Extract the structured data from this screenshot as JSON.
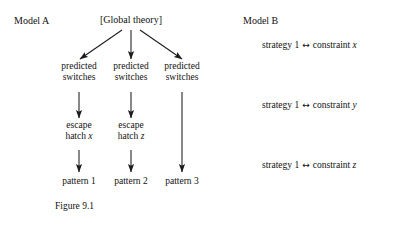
{
  "figure": {
    "caption": "Figure 9.1",
    "background_color": "#ffffff",
    "ink_color": "#1a1a1a"
  },
  "model_a": {
    "title": "Model A",
    "root": {
      "label": "[Global theory]"
    },
    "level_predicted": [
      {
        "line1": "predicted",
        "line2": "switches"
      },
      {
        "line1": "predicted",
        "line2": "switches"
      },
      {
        "line1": "predicted",
        "line2": "switches"
      }
    ],
    "level_escape": [
      {
        "line1": "escape",
        "line2": "hatch",
        "variable": "x"
      },
      {
        "line1": "escape",
        "line2": "hatch",
        "variable": "z"
      }
    ],
    "level_pattern": [
      {
        "label": "pattern 1"
      },
      {
        "label": "pattern 2"
      },
      {
        "label": "pattern 3"
      }
    ]
  },
  "model_b": {
    "title": "Model B",
    "arrow_glyph": "↔",
    "relations": [
      {
        "left": "strategy 1",
        "right": "constraint",
        "variable": "x"
      },
      {
        "left": "strategy 1",
        "right": "constraint",
        "variable": "y"
      },
      {
        "left": "strategy 1",
        "right": "constraint",
        "variable": "z"
      }
    ]
  }
}
